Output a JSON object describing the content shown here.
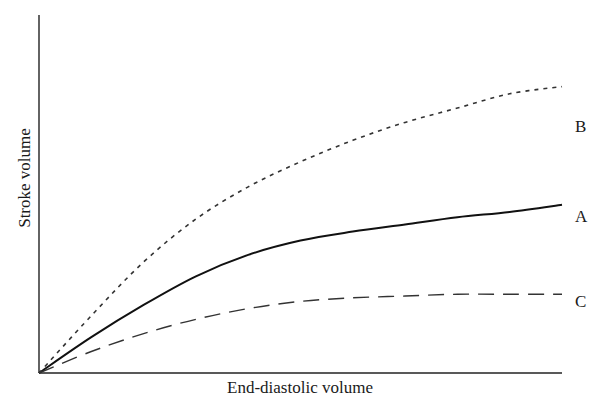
{
  "chart_data": {
    "type": "line",
    "title": "",
    "xlabel": "End-diastolic volume",
    "ylabel": "Stroke volume",
    "xlim": [
      0,
      10
    ],
    "ylim": [
      0,
      10
    ],
    "grid": false,
    "ticks": "none",
    "legend": "inline labels at right end of each curve",
    "x": [
      0,
      1,
      2,
      3,
      4,
      5,
      6,
      7,
      8,
      9,
      10
    ],
    "series": [
      {
        "name": "A",
        "style": "solid",
        "values": [
          0,
          1.0,
          1.9,
          2.7,
          3.3,
          3.7,
          3.95,
          4.15,
          4.35,
          4.5,
          4.7
        ]
      },
      {
        "name": "B",
        "style": "dotted",
        "values": [
          0,
          1.6,
          3.1,
          4.3,
          5.2,
          5.9,
          6.5,
          7.0,
          7.4,
          7.8,
          8.0
        ]
      },
      {
        "name": "C",
        "style": "dashed",
        "values": [
          0,
          0.6,
          1.1,
          1.5,
          1.8,
          2.0,
          2.1,
          2.15,
          2.2,
          2.2,
          2.2
        ]
      }
    ]
  }
}
